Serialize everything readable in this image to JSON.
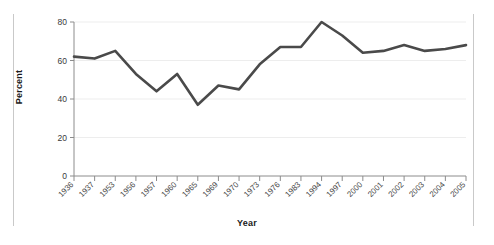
{
  "chart_data": {
    "type": "line",
    "title": "",
    "xlabel": "Year",
    "ylabel": "Percent",
    "categories": [
      "1936",
      "1937",
      "1953",
      "1956",
      "1957",
      "1960",
      "1965",
      "1969",
      "1970",
      "1973",
      "1976",
      "1983",
      "1994",
      "1997",
      "2000",
      "2001",
      "2002",
      "2003",
      "2004",
      "2005"
    ],
    "values": [
      62,
      61,
      65,
      53,
      44,
      53,
      37,
      47,
      45,
      58,
      67,
      67,
      80,
      73,
      64,
      65,
      68,
      65,
      66,
      68
    ],
    "series": [
      {
        "name": "Percent",
        "values": [
          62,
          61,
          65,
          53,
          44,
          53,
          37,
          47,
          45,
          58,
          67,
          67,
          80,
          73,
          64,
          65,
          68,
          65,
          66,
          68
        ]
      }
    ],
    "ylim": [
      0,
      80
    ],
    "yticks": [
      0,
      20,
      40,
      60,
      80
    ],
    "ytick_labels": [
      "0",
      "20",
      "40",
      "60",
      "80"
    ],
    "grid": "horizontal",
    "legend": "none",
    "line_color": "#4a4a4a",
    "grid_color": "#ededed",
    "axis_color": "#8c8c8c",
    "background": "#ffffff"
  },
  "figure": {
    "y_axis_title": "Percent",
    "x_axis_title": "Year"
  }
}
